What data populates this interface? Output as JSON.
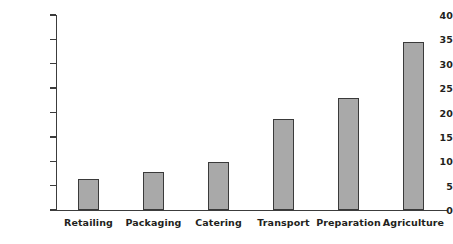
{
  "chart_data": {
    "type": "bar",
    "title": "",
    "subtitle": "",
    "xlabel": "",
    "ylabel": "Percentage",
    "categories": [
      "Retailing",
      "Packaging",
      "Catering",
      "Transport",
      "Preparation",
      "Agriculture"
    ],
    "values": [
      6.3,
      7.7,
      9.9,
      18.7,
      23.0,
      34.4
    ],
    "ylim": [
      0,
      40
    ],
    "yticks": [
      0,
      5,
      10,
      15,
      20,
      25,
      30,
      35,
      40
    ],
    "ytick_labels": [
      "0",
      "5",
      "10",
      "15",
      "20",
      "25",
      "30",
      "35",
      "40"
    ],
    "grid": false,
    "legend": null,
    "series": [
      {
        "name": "Percentage",
        "values": [
          6.3,
          7.7,
          9.9,
          18.7,
          23.0,
          34.4
        ]
      }
    ],
    "colors": {
      "bar_fill": "#a9a9a9",
      "bar_border": "#3a3a3a",
      "axis": "#3c3c3c",
      "text": "#231f20",
      "background": "#ffffff"
    }
  }
}
